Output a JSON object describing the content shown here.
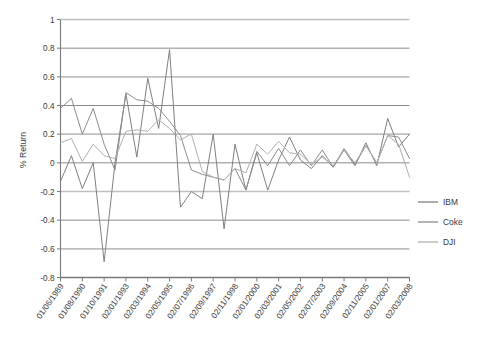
{
  "chart_data": {
    "type": "line",
    "title": "",
    "xlabel": "",
    "ylabel": "% Return",
    "ylim": [
      -0.8,
      1
    ],
    "ytick_step": 0.2,
    "grid": "horizontal",
    "legend_position": "right",
    "y_ticks": [
      "1",
      "0.8",
      "0.6",
      "0.4",
      "0.2",
      "0",
      "-0.2",
      "-0.4",
      "-0.6",
      "-0.8"
    ],
    "y_tick_values": [
      1,
      0.8,
      0.6,
      0.4,
      0.2,
      0,
      -0.2,
      -0.4,
      -0.6,
      -0.8
    ],
    "x_tick_labels": [
      "01/06/1989",
      "01/08/1990",
      "01/10/1991",
      "02/01/1993",
      "02/03/1994",
      "02/05/1995",
      "02/07/1996",
      "02/09/1997",
      "02/11/1998",
      "02/01/2000",
      "02/03/2001",
      "02/05/2002",
      "02/07/2003",
      "02/09/2004",
      "02/11/2005",
      "02/01/2007",
      "02/03/2008"
    ],
    "x_tick_indices": [
      0,
      2,
      4,
      6,
      8,
      10,
      12,
      14,
      16,
      18,
      20,
      22,
      24,
      26,
      28,
      30,
      32
    ],
    "n_points": 33,
    "series": [
      {
        "name": "IBM",
        "color": "#7f7f7f",
        "values": [
          -0.13,
          0.05,
          -0.18,
          0.0,
          -0.69,
          0.0,
          0.48,
          0.04,
          0.59,
          0.24,
          0.79,
          -0.31,
          -0.2,
          -0.25,
          0.2,
          -0.46,
          0.13,
          -0.19,
          0.07,
          -0.19,
          0.02,
          0.18,
          0.02,
          -0.04,
          0.05,
          -0.03,
          0.09,
          -0.02,
          0.14,
          -0.02,
          0.31,
          0.11,
          0.2
        ]
      },
      {
        "name": "Coke",
        "color": "#8c8c8c",
        "values": [
          0.38,
          0.45,
          0.2,
          0.38,
          0.13,
          -0.05,
          0.49,
          0.44,
          0.43,
          0.38,
          0.29,
          0.19,
          -0.05,
          -0.08,
          -0.1,
          -0.12,
          -0.04,
          -0.19,
          0.08,
          -0.02,
          0.1,
          -0.02,
          0.09,
          -0.02,
          0.09,
          -0.03,
          0.1,
          -0.01,
          0.12,
          0.0,
          0.19,
          0.18,
          0.03
        ]
      },
      {
        "name": "DJI",
        "color": "#b0b0b0",
        "values": [
          0.14,
          0.17,
          0.01,
          0.13,
          0.05,
          0.03,
          0.22,
          0.23,
          0.22,
          0.3,
          0.24,
          0.16,
          0.2,
          -0.06,
          -0.1,
          -0.12,
          -0.04,
          -0.07,
          0.13,
          0.06,
          0.15,
          0.07,
          0.06,
          -0.01,
          0.04,
          -0.02,
          0.09,
          0.0,
          0.12,
          0.0,
          0.19,
          0.13,
          -0.1
        ]
      }
    ]
  },
  "legend": {
    "entries": [
      {
        "label": "IBM"
      },
      {
        "label": "Coke"
      },
      {
        "label": "DJI"
      }
    ]
  },
  "axis": {
    "y_title": "% Return"
  },
  "colors": {
    "grid_light": "#bfbfbf",
    "grid_dark": "#6d6d6d",
    "axis": "#7a7a7a",
    "text": "#39393a",
    "background": "#ffffff"
  }
}
